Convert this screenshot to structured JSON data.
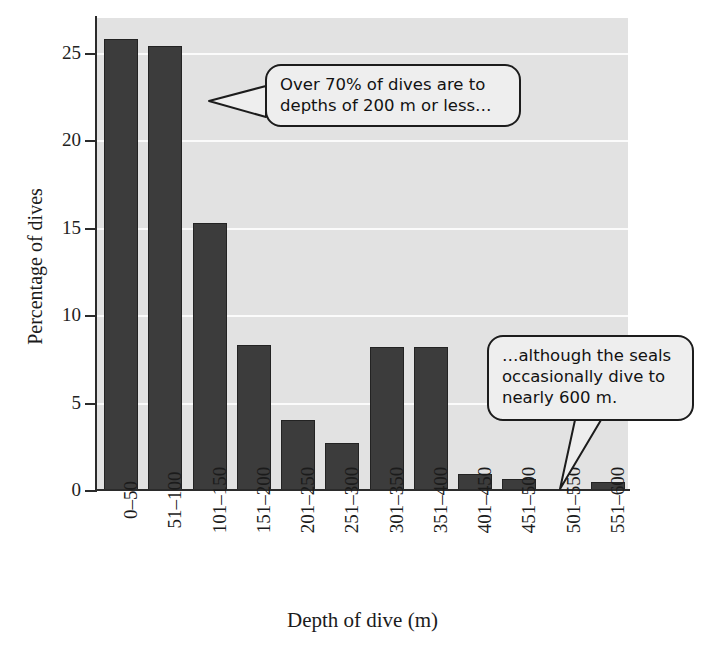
{
  "chart_data": {
    "type": "bar",
    "title": "",
    "xlabel": "Depth of dive (m)",
    "ylabel": "Percentage of dives",
    "categories": [
      "0–50",
      "51–100",
      "101–150",
      "151–200",
      "201–250",
      "251–300",
      "301–350",
      "351–400",
      "401–450",
      "451–500",
      "501–550",
      "551–600"
    ],
    "values": [
      25.8,
      25.4,
      15.3,
      8.3,
      4.0,
      2.7,
      8.2,
      8.2,
      0.9,
      0.65,
      0.0,
      0.45
    ],
    "ylim": [
      0,
      27
    ],
    "yticks": [
      0,
      5,
      10,
      15,
      20,
      25
    ],
    "ytick_labels": [
      "0",
      "5",
      "10",
      "15",
      "20",
      "25"
    ],
    "grid": "horizontal-white-gridlines",
    "legend": "none",
    "bar_color": "#3c3c3c",
    "plot_background": "#e2e2e2",
    "annotations": [
      {
        "id": "callout-1",
        "line1": "Over 70% of dives are to",
        "line2": "depths of 200 m or less…",
        "points_to": "left toward tall bars (0–100 m)"
      },
      {
        "id": "callout-2",
        "line1": "…although the seals",
        "line2": "occasionally dive to",
        "line3": "nearly 600 m.",
        "points_to": "551–600 bar"
      }
    ]
  }
}
